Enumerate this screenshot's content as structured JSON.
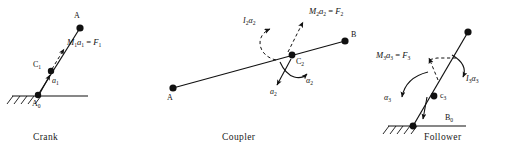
{
  "figure": {
    "background": "#ffffff",
    "ink": "#111111"
  },
  "panels": [
    {
      "id": "crank",
      "caption": "Crank",
      "caption_pos": [
        33,
        136
      ],
      "points": [
        {
          "name": "A",
          "label": "A",
          "x": 80,
          "y": 28,
          "label_pos": [
            75,
            18
          ]
        },
        {
          "name": "C1",
          "label": "C",
          "sub": "1",
          "x": 51,
          "y": 71,
          "label_pos": [
            36,
            63
          ]
        },
        {
          "name": "A0",
          "label": "A",
          "sub": "0",
          "x": 38,
          "y": 95,
          "label_pos": [
            33,
            104
          ]
        }
      ],
      "link_line": {
        "x1": 38,
        "y1": 95,
        "x2": 80,
        "y2": 28
      },
      "ground": {
        "x1": 12,
        "y1": 96,
        "x2": 88,
        "y2": 96,
        "hatch_from": 12,
        "hatch_to": 40
      },
      "vectors": [
        {
          "name": "inertia-force",
          "label_html": "<i>M</i><sub>1</sub><i>a</i><sub>1</sub> = <i>F</i><sub>1</sub>",
          "label_pos": [
            69,
            40
          ],
          "x1": 57,
          "y1": 62,
          "x2": 65,
          "y2": 47,
          "dashed": true
        },
        {
          "name": "acceleration",
          "label_html": "<i>a</i><sub>1</sub>",
          "label_pos": [
            53,
            81
          ],
          "x1": 40,
          "y1": 93,
          "x2": 51,
          "y2": 74,
          "dashed": false
        }
      ]
    },
    {
      "id": "coupler",
      "caption": "Coupler",
      "caption_pos": [
        222,
        136
      ],
      "points": [
        {
          "name": "A",
          "label": "A",
          "x": 173,
          "y": 88,
          "label_pos": [
            168,
            99
          ]
        },
        {
          "name": "B",
          "label": "B",
          "x": 345,
          "y": 41,
          "label_pos": [
            350,
            35
          ]
        },
        {
          "name": "C2",
          "label": "C",
          "sub": "2",
          "x": 292,
          "y": 55,
          "label_pos": [
            297,
            60
          ]
        }
      ],
      "link_line": {
        "x1": 173,
        "y1": 88,
        "x2": 345,
        "y2": 41
      },
      "vectors": [
        {
          "name": "inertia-torque",
          "label_html": "<i>I</i><sub>2</sub><i>&alpha;</i><sub>2</sub>",
          "label_pos": [
            246,
            20
          ],
          "curved": true
        },
        {
          "name": "inertia-force",
          "label_html": "<i>M</i><sub>2</sub><i>a</i><sub>2</sub> = <i>F</i><sub>2</sub>",
          "label_pos": [
            311,
            11
          ],
          "x1": 288,
          "y1": 52,
          "x2": 304,
          "y2": 20,
          "dashed": true
        },
        {
          "name": "acceleration",
          "label_html": "<i>a</i><sub>2</sub>",
          "label_pos": [
            272,
            94
          ],
          "x1": 290,
          "y1": 60,
          "x2": 276,
          "y2": 86,
          "dashed": false
        },
        {
          "name": "angular-acceleration",
          "label_html": "<i>&alpha;</i><sub>2</sub>",
          "label_pos": [
            296,
            86
          ],
          "curved": true
        }
      ]
    },
    {
      "id": "follower",
      "caption": "Follower",
      "caption_pos": [
        424,
        136
      ],
      "points": [
        {
          "name": "B",
          "label": "",
          "x": 468,
          "y": 32
        },
        {
          "name": "C3",
          "label": "c",
          "sub": "3",
          "x": 434,
          "y": 96,
          "label_pos": [
            440,
            95
          ]
        },
        {
          "name": "B0",
          "label": "B",
          "sub": "0",
          "x": 420,
          "y": 123,
          "label_pos": [
            447,
            120
          ]
        }
      ],
      "link_line": {
        "x1": 413,
        "y1": 126,
        "x2": 468,
        "y2": 32
      },
      "ground": {
        "x1": 388,
        "y1": 126,
        "x2": 466,
        "y2": 126,
        "hatch_from": 388,
        "hatch_to": 416
      },
      "vectors": [
        {
          "name": "inertia-force",
          "label_html": "<i>M</i><sub>3</sub><i>a</i><sub>3</sub> = <i>F</i><sub>3</sub>",
          "label_pos": [
            378,
            53
          ],
          "x1": 437,
          "y1": 92,
          "x2": 427,
          "y2": 58,
          "dashed": true
        },
        {
          "name": "inertia-torque",
          "label_html": "<i>I</i><sub>3</sub><i>&alpha;</i><sub>3</sub>",
          "label_pos": [
            465,
            74
          ],
          "curved": true
        },
        {
          "name": "angular-acceleration",
          "label_html": "<i>&alpha;</i><sub>3</sub>",
          "label_pos": [
            388,
            95
          ],
          "curved": true
        },
        {
          "name": "reaction",
          "label_html": "",
          "x1": 424,
          "y1": 97,
          "x2": 422,
          "y2": 119,
          "dashed": false
        }
      ]
    }
  ]
}
